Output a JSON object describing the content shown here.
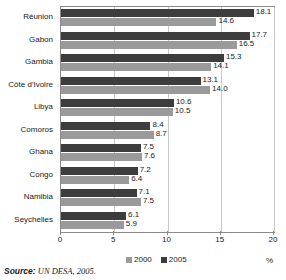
{
  "chart_data": {
    "type": "bar",
    "orientation": "horizontal",
    "title": "",
    "xlabel": "%",
    "ylabel": "",
    "xlim": [
      0,
      20
    ],
    "xticks": [
      0,
      5,
      10,
      15,
      20
    ],
    "grid": true,
    "legend_position": "bottom",
    "categories": [
      "Réunion",
      "Gabon",
      "Gambia",
      "Côte d'Ivoire",
      "Libya",
      "Comoros",
      "Ghana",
      "Congo",
      "Namibia",
      "Seychelles"
    ],
    "series": [
      {
        "name": "2000",
        "color": "#9a9a9a",
        "values": [
          14.6,
          16.5,
          14.1,
          14.0,
          10.5,
          8.7,
          7.6,
          6.4,
          7.5,
          5.9
        ]
      },
      {
        "name": "2005",
        "color": "#3d3d3d",
        "values": [
          18.1,
          17.7,
          15.3,
          13.1,
          10.6,
          8.4,
          7.5,
          7.2,
          7.1,
          6.1
        ]
      }
    ]
  },
  "axis": {
    "unit_label": "%",
    "tick_labels": [
      "0",
      "5",
      "10",
      "15",
      "20"
    ]
  },
  "legend": {
    "items": [
      {
        "label": "2000"
      },
      {
        "label": "2005"
      }
    ]
  },
  "source": {
    "prefix": "Source:",
    "text": " UN DESA, 2005."
  },
  "colors": {
    "series_2000": "#9a9a9a",
    "series_2005": "#3d3d3d",
    "frame": "#8a8a8a",
    "grid": "#c8c8c8"
  }
}
